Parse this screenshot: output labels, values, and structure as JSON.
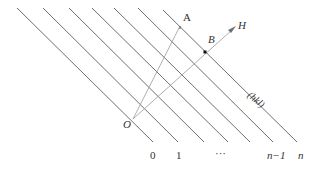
{
  "diagram": {
    "points": {
      "origin": "O",
      "a": "A",
      "b": "B",
      "h": "H"
    },
    "plane_label": "(hkl)",
    "index_labels": [
      "0",
      "1",
      "···",
      "n−1",
      "n"
    ],
    "colors": {
      "line": "#707070",
      "vector": "#9a9a9a",
      "text": "#333333"
    }
  }
}
